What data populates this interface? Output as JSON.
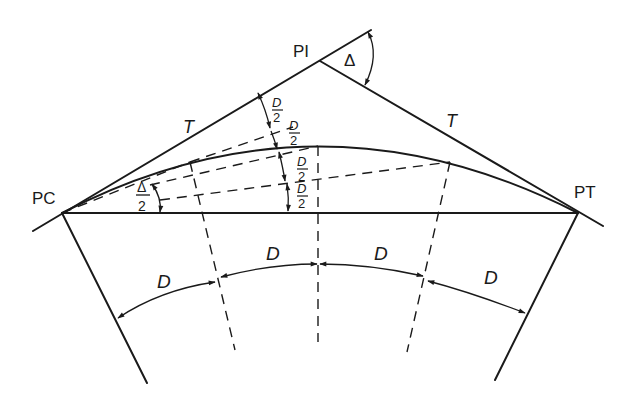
{
  "diagram": {
    "points": {
      "pc": "PC",
      "pi": "PI",
      "pt": "PT"
    },
    "labels": {
      "tangent_left": "T",
      "tangent_right": "T",
      "delta": "Δ",
      "half_delta_num": "Δ",
      "half_delta_den": "2",
      "half_d_num": "D",
      "half_d_den": "2",
      "arc_d": "D"
    },
    "deflection_labels": [
      {
        "num": "D",
        "den": "2"
      },
      {
        "num": "D",
        "den": "2"
      },
      {
        "num": "D",
        "den": "2"
      },
      {
        "num": "D",
        "den": "2"
      }
    ],
    "arc_labels": [
      "D",
      "D",
      "D",
      "D"
    ],
    "colors": {
      "ink": "#1a1a1a",
      "background": "#ffffff"
    }
  }
}
